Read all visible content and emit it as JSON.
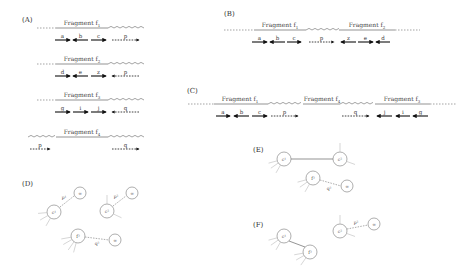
{
  "panels": {
    "A": {
      "label": "(A)",
      "rows": [
        {
          "fragment": "Fragment f1",
          "frag_sub": "1",
          "left": "dashed",
          "right": "zigzag",
          "reads": [
            {
              "name": "a",
              "dir": "right",
              "style": "solid"
            },
            {
              "name": "b",
              "dir": "left",
              "style": "solid"
            },
            {
              "name": "c",
              "dir": "right",
              "style": "solid"
            },
            {
              "name": "p",
              "dir": "right",
              "style": "dashed"
            }
          ]
        },
        {
          "fragment": "Fragment f2",
          "frag_sub": "2",
          "left": "dashed",
          "right": "zigzag",
          "reads": [
            {
              "name": "d",
              "dir": "right",
              "style": "solid"
            },
            {
              "name": "e",
              "dir": "left",
              "style": "solid"
            },
            {
              "name": "z",
              "dir": "right",
              "style": "solid"
            },
            {
              "name": "p",
              "dir": "left",
              "style": "dashed"
            }
          ]
        },
        {
          "fragment": "Fragment f3",
          "frag_sub": "3",
          "left": "dashed",
          "right": "zigzag",
          "reads": [
            {
              "name": "g",
              "dir": "right",
              "style": "solid"
            },
            {
              "name": "i",
              "dir": "right",
              "style": "solid"
            },
            {
              "name": "j",
              "dir": "right",
              "style": "solid"
            },
            {
              "name": "q",
              "dir": "left",
              "style": "dashed"
            }
          ]
        },
        {
          "fragment": "Fragment f4",
          "frag_sub": "4",
          "left": "zigzag",
          "right": "zigzag",
          "reads": [
            {
              "name": "p",
              "dir": "right",
              "style": "dashed"
            },
            {
              "name": "q",
              "dir": "right",
              "style": "dashed"
            }
          ]
        }
      ]
    },
    "B": {
      "label": "(B)",
      "fragments": [
        "Fragment f1",
        "Fragment f2"
      ],
      "frag_subs": [
        "1",
        "2"
      ],
      "reads": [
        {
          "name": "a",
          "dir": "right",
          "style": "solid"
        },
        {
          "name": "b",
          "dir": "left",
          "style": "solid"
        },
        {
          "name": "c",
          "dir": "right",
          "style": "solid"
        },
        {
          "name": "p",
          "dir": "right",
          "style": "dashed"
        },
        {
          "name": "z",
          "dir": "left",
          "style": "solid"
        },
        {
          "name": "e",
          "dir": "right",
          "style": "solid"
        },
        {
          "name": "d",
          "dir": "left",
          "style": "solid"
        }
      ]
    },
    "C": {
      "label": "(C)",
      "fragments": [
        "Fragment f1",
        "Fragment f4",
        "Fragment f3"
      ],
      "frag_subs": [
        "1",
        "4",
        "3"
      ],
      "reads": [
        {
          "name": "a",
          "dir": "right",
          "style": "solid"
        },
        {
          "name": "b",
          "dir": "left",
          "style": "solid"
        },
        {
          "name": "c",
          "dir": "right",
          "style": "solid"
        },
        {
          "name": "p",
          "dir": "right",
          "style": "dashed"
        },
        {
          "name": "q",
          "dir": "right",
          "style": "dashed"
        },
        {
          "name": "j",
          "dir": "left",
          "style": "solid"
        },
        {
          "name": "i",
          "dir": "left",
          "style": "solid"
        },
        {
          "name": "g",
          "dir": "left",
          "style": "solid"
        }
      ]
    },
    "D": {
      "label": "(D)",
      "nodes": [
        {
          "id": "f1",
          "label": "c¹"
        },
        {
          "id": "f2",
          "label": "c²"
        },
        {
          "id": "f3",
          "label": "f³"
        },
        {
          "id": "inf1",
          "label": "∞"
        },
        {
          "id": "inf2",
          "label": "∞"
        },
        {
          "id": "inf3",
          "label": "∞"
        }
      ],
      "edges": [
        {
          "from": "f1",
          "to": "inf1",
          "label": "p¹",
          "style": "dashed"
        },
        {
          "from": "f2",
          "to": "inf2",
          "label": "p²",
          "style": "dashed"
        },
        {
          "from": "f3",
          "to": "inf3",
          "label": "q³",
          "style": "dashed"
        }
      ]
    },
    "E": {
      "label": "(E)",
      "nodes": [
        {
          "id": "f1",
          "label": "c¹"
        },
        {
          "id": "f2",
          "label": "c²"
        },
        {
          "id": "f3",
          "label": "f³"
        },
        {
          "id": "inf3",
          "label": "∞"
        }
      ],
      "edges": [
        {
          "from": "f1",
          "to": "f2",
          "label": "",
          "style": "solid"
        },
        {
          "from": "f3",
          "to": "inf3",
          "label": "q³",
          "style": "dashed"
        }
      ]
    },
    "F": {
      "label": "(F)",
      "nodes": [
        {
          "id": "f1",
          "label": "c¹"
        },
        {
          "id": "f3",
          "label": "f³"
        },
        {
          "id": "f2",
          "label": "c²"
        },
        {
          "id": "inf2",
          "label": "∞"
        }
      ],
      "edges": [
        {
          "from": "f1",
          "to": "f3",
          "label": "",
          "style": "solid"
        },
        {
          "from": "f2",
          "to": "inf2",
          "label": "p²",
          "style": "dashed"
        }
      ]
    }
  }
}
